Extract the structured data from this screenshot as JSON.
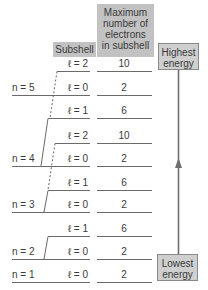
{
  "headers": {
    "subshell": "Subshell",
    "max_electrons": [
      "Maximum",
      "number of",
      "electrons",
      "in subshell"
    ],
    "highest": [
      "Highest",
      "energy"
    ],
    "lowest": [
      "Lowest",
      "energy"
    ]
  },
  "rows": [
    {
      "n": "",
      "l": "ℓ = 2",
      "max": "10"
    },
    {
      "n": "n = 5",
      "l": "ℓ = 0",
      "max": "2"
    },
    {
      "n": "",
      "l": "ℓ = 1",
      "max": "6"
    },
    {
      "n": "",
      "l": "ℓ = 2",
      "max": "10"
    },
    {
      "n": "n = 4",
      "l": "ℓ = 0",
      "max": "2"
    },
    {
      "n": "",
      "l": "ℓ = 1",
      "max": "6"
    },
    {
      "n": "n = 3",
      "l": "ℓ = 0",
      "max": "2"
    },
    {
      "n": "",
      "l": "ℓ = 1",
      "max": "6"
    },
    {
      "n": "n = 2",
      "l": "ℓ = 0",
      "max": "2"
    },
    {
      "n": "n = 1",
      "l": "ℓ = 0",
      "max": "2"
    }
  ],
  "colors": {
    "header_fill": "#c2c2c2",
    "line": "#6a6a6a",
    "arrow": "#6e6e6e"
  }
}
